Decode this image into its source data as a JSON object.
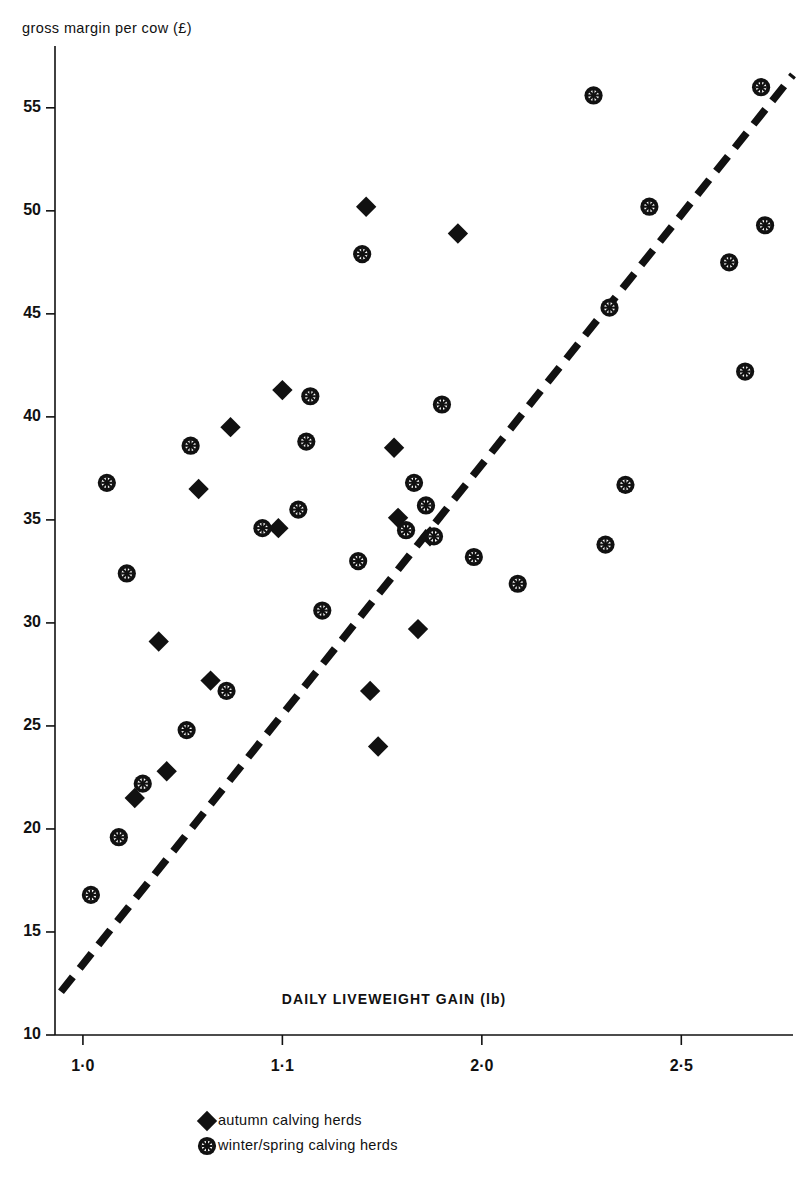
{
  "chart_data": {
    "type": "scatter",
    "title": "",
    "xlabel": "DAILY LIVEWEIGHT GAIN (lb)",
    "ylabel": "gross margin per cow (£)",
    "grid": false,
    "legend_position": "bottom-center",
    "xlim": [
      0.93,
      2.78
    ],
    "ylim": [
      10,
      58
    ],
    "xticks": [
      1.0,
      1.5,
      2.0,
      2.5
    ],
    "xtick_labels": [
      "1·0",
      "1·1",
      "2·0",
      "2·5"
    ],
    "yticks": [
      10,
      15,
      20,
      25,
      30,
      35,
      40,
      45,
      50,
      55
    ],
    "ytick_labels": [
      "10",
      "15",
      "20",
      "25",
      "30",
      "35",
      "40",
      "45",
      "50",
      "55"
    ],
    "series": [
      {
        "name": "autumn calving herds",
        "marker": "filled-diamond",
        "color": "#111111",
        "points": [
          [
            1.71,
            50.2
          ],
          [
            1.94,
            48.9
          ],
          [
            1.5,
            41.3
          ],
          [
            1.37,
            39.5
          ],
          [
            1.78,
            38.5
          ],
          [
            1.29,
            36.5
          ],
          [
            1.79,
            35.1
          ],
          [
            1.49,
            34.6
          ],
          [
            1.87,
            34.2
          ],
          [
            1.84,
            29.7
          ],
          [
            1.19,
            29.1
          ],
          [
            1.32,
            27.2
          ],
          [
            1.72,
            26.7
          ],
          [
            1.74,
            24.0
          ],
          [
            1.21,
            22.8
          ],
          [
            1.13,
            21.5
          ]
        ]
      },
      {
        "name": "winter/spring calving herds",
        "marker": "spoked-circle",
        "color": "#111111",
        "points": [
          [
            2.28,
            55.6
          ],
          [
            2.7,
            56.0
          ],
          [
            2.42,
            50.2
          ],
          [
            1.7,
            47.9
          ],
          [
            2.62,
            47.5
          ],
          [
            2.71,
            49.3
          ],
          [
            2.32,
            45.3
          ],
          [
            2.66,
            42.2
          ],
          [
            1.57,
            41.0
          ],
          [
            1.9,
            40.6
          ],
          [
            1.56,
            38.8
          ],
          [
            1.27,
            38.6
          ],
          [
            1.83,
            36.8
          ],
          [
            1.06,
            36.8
          ],
          [
            2.36,
            36.7
          ],
          [
            1.86,
            35.7
          ],
          [
            1.54,
            35.5
          ],
          [
            1.45,
            34.6
          ],
          [
            1.81,
            34.5
          ],
          [
            1.88,
            34.2
          ],
          [
            2.31,
            33.8
          ],
          [
            1.98,
            33.2
          ],
          [
            1.69,
            33.0
          ],
          [
            2.09,
            31.9
          ],
          [
            1.11,
            32.4
          ],
          [
            1.6,
            30.6
          ],
          [
            1.36,
            26.7
          ],
          [
            1.26,
            24.8
          ],
          [
            1.15,
            22.2
          ],
          [
            1.09,
            19.6
          ],
          [
            1.02,
            16.8
          ]
        ]
      }
    ],
    "trend_line": {
      "style": "dashed",
      "x": [
        0.945,
        2.78
      ],
      "y": [
        12.1,
        56.6
      ]
    }
  },
  "legend": {
    "items": [
      {
        "label": "autumn calving herds",
        "marker": "filled-diamond"
      },
      {
        "label": "winter/spring calving herds",
        "marker": "spoked-circle"
      }
    ]
  }
}
